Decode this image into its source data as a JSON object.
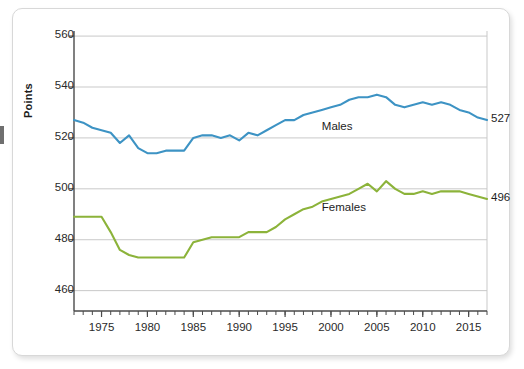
{
  "card": {
    "background": "#ffffff",
    "border_color": "#d8d8d8"
  },
  "chart_data": {
    "type": "line",
    "title": "",
    "subtitle": "",
    "xlabel": "",
    "ylabel": "Points",
    "xlim": [
      1972,
      2017
    ],
    "ylim": [
      452,
      562
    ],
    "ytick_values": [
      460,
      480,
      500,
      520,
      540,
      560
    ],
    "ytick_labels": [
      "460",
      "480",
      "500",
      "520",
      "540",
      "560"
    ],
    "xtick_values": [
      1975,
      1980,
      1985,
      1990,
      1995,
      2000,
      2005,
      2010,
      2015
    ],
    "xtick_labels": [
      "1975",
      "1980",
      "1985",
      "1990",
      "1995",
      "2000",
      "2005",
      "2010",
      "2015"
    ],
    "minor_xtick_step": 1,
    "grid": "horizontal",
    "legend_position": "inline-annotations",
    "x": [
      1972,
      1973,
      1974,
      1975,
      1976,
      1977,
      1978,
      1979,
      1980,
      1981,
      1982,
      1983,
      1984,
      1985,
      1986,
      1987,
      1988,
      1989,
      1990,
      1991,
      1992,
      1993,
      1994,
      1995,
      1996,
      1997,
      1998,
      1999,
      2000,
      2001,
      2002,
      2003,
      2004,
      2005,
      2006,
      2007,
      2008,
      2009,
      2010,
      2011,
      2012,
      2013,
      2014,
      2015,
      2016,
      2017
    ],
    "series": [
      {
        "name": "Males",
        "color": "#3d93c4",
        "end_label": "527",
        "annotation": "Males",
        "values": [
          527,
          526,
          524,
          523,
          522,
          518,
          521,
          516,
          514,
          514,
          515,
          515,
          515,
          520,
          521,
          521,
          520,
          521,
          519,
          522,
          521,
          523,
          525,
          527,
          527,
          529,
          530,
          531,
          532,
          533,
          535,
          536,
          536,
          537,
          536,
          533,
          532,
          533,
          534,
          533,
          534,
          533,
          531,
          530,
          528,
          527
        ]
      },
      {
        "name": "Females",
        "color": "#8cb33a",
        "end_label": "496",
        "annotation": "Females",
        "values": [
          489,
          489,
          489,
          489,
          483,
          476,
          474,
          473,
          473,
          473,
          473,
          473,
          473,
          479,
          480,
          481,
          481,
          481,
          481,
          483,
          483,
          483,
          485,
          488,
          490,
          492,
          493,
          495,
          496,
          497,
          498,
          500,
          502,
          499,
          503,
          500,
          498,
          498,
          499,
          498,
          499,
          499,
          499,
          498,
          497,
          496
        ]
      }
    ]
  },
  "annotations": {
    "males_label": "Males",
    "females_label": "Females",
    "males_end": "527",
    "females_end": "496"
  }
}
